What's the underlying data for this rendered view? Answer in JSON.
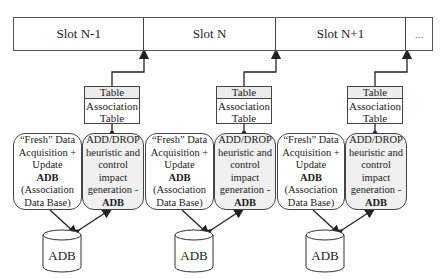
{
  "slots": [
    "Slot N-1",
    "Slot N",
    "Slot N+1",
    "..."
  ],
  "groups": [
    {
      "table": {
        "header": "Table",
        "body_line1": "Association",
        "body_line2": "Table"
      },
      "acquisition": {
        "line1": "“Fresh” Data",
        "line2": "Acquisition +",
        "line3": "Update",
        "line4_bold": "ADB",
        "line5": "(Association",
        "line6": "Data Base)"
      },
      "heuristic": {
        "line1": "ADD/DROP",
        "line2": "heuristic and",
        "line3": "control",
        "line4": "impact",
        "line5": "generation -",
        "line6_bold": "ADB"
      },
      "database": "ADB"
    },
    {
      "table": {
        "header": "Table",
        "body_line1": "Association",
        "body_line2": "Table"
      },
      "acquisition": {
        "line1": "“Fresh” Data",
        "line2": "Acquisition +",
        "line3": "Update",
        "line4_bold": "ADB",
        "line5": "(Association",
        "line6": "Data Base)"
      },
      "heuristic": {
        "line1": "ADD/DROP",
        "line2": "heuristic and",
        "line3": "control",
        "line4": "impact",
        "line5": "generation -",
        "line6_bold": "ADB"
      },
      "database": "ADB"
    },
    {
      "table": {
        "header": "Table",
        "body_line1": "Association",
        "body_line2": "Table"
      },
      "acquisition": {
        "line1": "“Fresh” Data",
        "line2": "Acquisition +",
        "line3": "Update",
        "line4_bold": "ADB",
        "line5": "(Association",
        "line6": "Data Base)"
      },
      "heuristic": {
        "line1": "ADD/DROP",
        "line2": "heuristic and",
        "line3": "control",
        "line4": "impact",
        "line5": "generation -",
        "line6_bold": "ADB"
      },
      "database": "ADB"
    }
  ]
}
